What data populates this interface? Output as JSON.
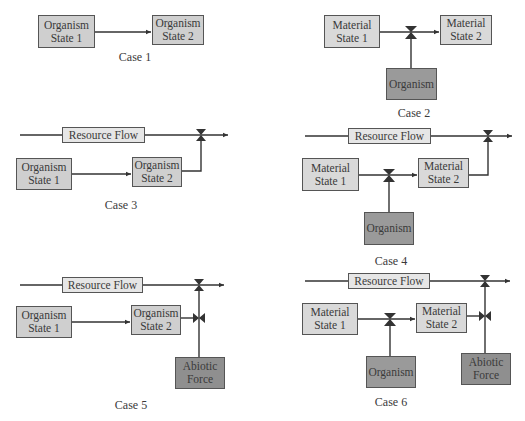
{
  "colors": {
    "line": "#333333",
    "state_fill": "#cfcfcf",
    "material_fill": "#d9d9d9",
    "organism_fill": "#9a9a9a",
    "abiotic_fill": "#8f8f8f",
    "resource_fill": "#e6e6e6"
  },
  "cases": [
    {
      "caption": "Case 1",
      "nodes": {
        "state1": "Organism\nState 1",
        "state2": "Organism\nState 2"
      }
    },
    {
      "caption": "Case 2",
      "nodes": {
        "state1": "Material\nState 1",
        "state2": "Material\nState 2",
        "organism": "Organism"
      }
    },
    {
      "caption": "Case 3",
      "nodes": {
        "resource": "Resource Flow",
        "state1": "Organism\nState 1",
        "state2": "Organism\nState 2"
      }
    },
    {
      "caption": "Case 4",
      "nodes": {
        "resource": "Resource Flow",
        "state1": "Material\nState 1",
        "state2": "Material\nState 2",
        "organism": "Organism"
      }
    },
    {
      "caption": "Case 5",
      "nodes": {
        "resource": "Resource Flow",
        "state1": "Organism\nState 1",
        "state2": "Organism\nState 2",
        "abiotic": "Abiotic\nForce"
      }
    },
    {
      "caption": "Case 6",
      "nodes": {
        "resource": "Resource Flow",
        "state1": "Material\nState 1",
        "state2": "Material\nState 2",
        "organism": "Organism",
        "abiotic": "Abiotic\nForce"
      }
    }
  ]
}
